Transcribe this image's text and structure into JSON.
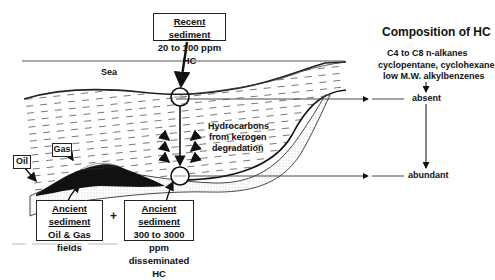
{
  "diagram": {
    "title": "Composition of HC",
    "composition_lines": [
      "C4 to C8 n-alkanes",
      "cyclopentane, cyclohexane",
      "low M.W. alkylbenzenes"
    ],
    "levels": {
      "top": "absent",
      "bottom": "abundant"
    },
    "labels": {
      "sea": "Sea",
      "oil": "Oil",
      "gas": "Gas",
      "hydrocarbons": [
        "Hydrocarbons",
        "from kerogen",
        "degradation"
      ],
      "plus": "+"
    },
    "boxes": {
      "recent": {
        "title": "Recent sediment",
        "line2": "20 to 100 ppm HC"
      },
      "ancient_fields": {
        "title": "Ancient sediment",
        "line2": "Oil & Gas",
        "line3": "fields"
      },
      "ancient_disseminated": {
        "title": "Ancient sediment",
        "line2": "300 to 3000 ppm",
        "line3": "disseminated HC"
      }
    }
  }
}
